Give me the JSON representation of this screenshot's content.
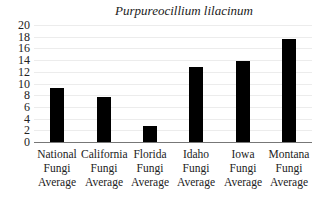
{
  "chart_data": {
    "type": "bar",
    "title": "Purpureocillium lilacinum",
    "xlabel": "",
    "ylabel": "",
    "ylim": [
      0,
      20
    ],
    "yticks": [
      0,
      2,
      4,
      6,
      8,
      10,
      12,
      14,
      16,
      18,
      20
    ],
    "grid": true,
    "legend": null,
    "categories": [
      "National Fungi Average",
      "California Fungi Average",
      "Florida Fungi Average",
      "Idaho Fungi Average",
      "Iowa Fungi Average",
      "Montana Fungi Average"
    ],
    "category_lines": [
      [
        "National",
        "Fungi",
        "Average"
      ],
      [
        "California",
        "Fungi",
        "Average"
      ],
      [
        "Florida",
        "Fungi",
        "Average"
      ],
      [
        "Idaho",
        "Fungi",
        "Average"
      ],
      [
        "Iowa",
        "Fungi",
        "Average"
      ],
      [
        "Montana",
        "Fungi",
        "Average"
      ]
    ],
    "values": [
      9.2,
      7.7,
      2.7,
      12.8,
      13.9,
      17.6
    ],
    "bar_color": "#000000"
  }
}
